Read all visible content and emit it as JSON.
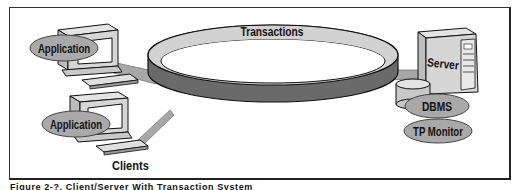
{
  "diagram": {
    "ring_label": "Transactions",
    "clients": [
      {
        "label": "Application"
      },
      {
        "label": "Application"
      }
    ],
    "clients_caption": "Clients",
    "server": {
      "label": "Server",
      "components": [
        "DBMS",
        "TP Monitor"
      ]
    }
  },
  "caption": "Figure 2-?.  Client/Server With Transaction System",
  "colors": {
    "ring_top": "#d2d2d2",
    "ring_side": "#6a6a6a",
    "connector": "#a8a8a8",
    "ellipse": "#a9a9a9",
    "device": "#d6d6d6",
    "outline": "#111111"
  }
}
